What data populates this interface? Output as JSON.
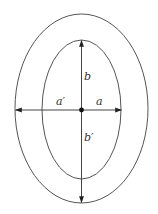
{
  "diagram": {
    "type": "concentric-ellipses",
    "colors": {
      "stroke": "#555555",
      "arrow": "#222222",
      "text": "#333333",
      "background": "#ffffff"
    },
    "outer_ellipse": {
      "cx": 81.5,
      "cy": 108.5,
      "rx": 66.5,
      "ry": 94.5
    },
    "inner_ellipse": {
      "cx": 81.5,
      "cy": 109.5,
      "rx": 39.5,
      "ry": 69.5
    },
    "center_point": {
      "x": 81.5,
      "y": 110
    },
    "labels": {
      "b": "b",
      "b_prime": "b′",
      "a_prime": "a′",
      "a": "a"
    }
  }
}
